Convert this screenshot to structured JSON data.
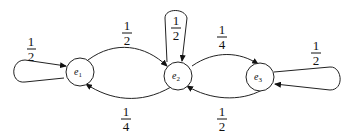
{
  "diagram": {
    "type": "markov-chain-state-diagram",
    "nodes": [
      {
        "id": "e1",
        "label": "e",
        "subscript": "1"
      },
      {
        "id": "e2",
        "label": "e",
        "subscript": "2"
      },
      {
        "id": "e3",
        "label": "e",
        "subscript": "3"
      }
    ],
    "edges": [
      {
        "from": "e1",
        "to": "e1",
        "num": "1",
        "den": "2"
      },
      {
        "from": "e1",
        "to": "e2",
        "num": "1",
        "den": "2"
      },
      {
        "from": "e2",
        "to": "e2",
        "num": "1",
        "den": "2"
      },
      {
        "from": "e2",
        "to": "e1",
        "num": "1",
        "den": "4"
      },
      {
        "from": "e2",
        "to": "e3",
        "num": "1",
        "den": "4"
      },
      {
        "from": "e3",
        "to": "e2",
        "num": "1",
        "den": "2"
      },
      {
        "from": "e3",
        "to": "e3",
        "num": "1",
        "den": "2"
      }
    ]
  }
}
